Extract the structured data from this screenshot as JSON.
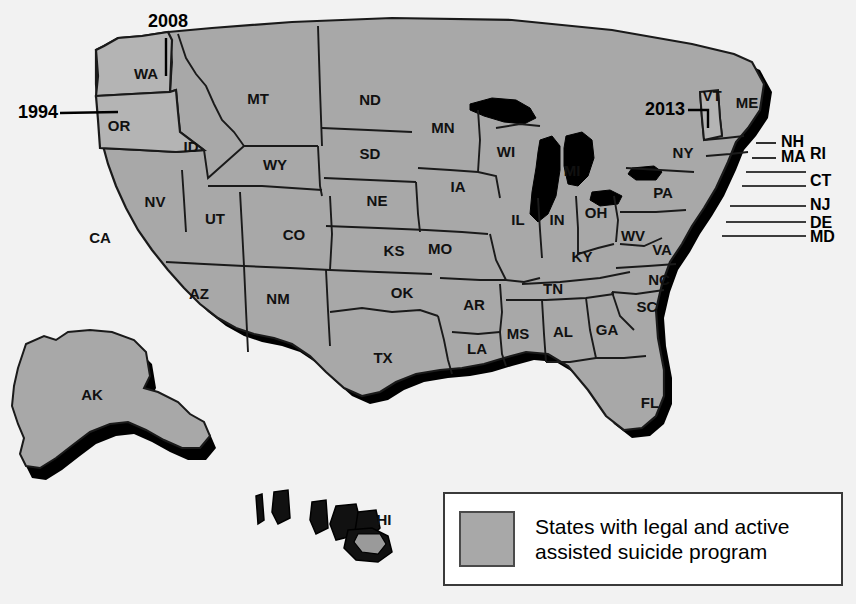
{
  "image": {
    "kind": "map",
    "region": "United States",
    "background_color": "#f2f2f2"
  },
  "colors": {
    "state_fill": "#a8a8a8",
    "state_fill_highlight": "#b4b4b4",
    "state_border": "#1a1a1a",
    "shadow": "#000000",
    "water": "#000000",
    "label_text": "#111111",
    "legend_background": "#ffffff",
    "legend_border": "#3a3a3a",
    "legend_swatch": "#a8a8a8"
  },
  "legend": {
    "swatch_name": "legend-color-swatch",
    "line1": "States with legal and active",
    "line2": "assisted suicide program",
    "full_text": "States with legal and active assisted suicide program"
  },
  "callouts": [
    {
      "id": "or-1994",
      "label": "1994",
      "points_to": "OR",
      "x": 18,
      "y": 113
    },
    {
      "id": "wa-2008",
      "label": "2008",
      "points_to": "WA",
      "x": 148,
      "y": 22
    },
    {
      "id": "vt-2013",
      "label": "2013",
      "points_to": "VT",
      "x": 645,
      "y": 110
    }
  ],
  "state_labels": [
    {
      "code": "WA",
      "x": 146,
      "y": 75
    },
    {
      "code": "OR",
      "x": 119,
      "y": 127
    },
    {
      "code": "ID",
      "x": 191,
      "y": 148
    },
    {
      "code": "MT",
      "x": 258,
      "y": 100
    },
    {
      "code": "ND",
      "x": 370,
      "y": 101
    },
    {
      "code": "SD",
      "x": 370,
      "y": 155
    },
    {
      "code": "MN",
      "x": 443,
      "y": 129
    },
    {
      "code": "WI",
      "x": 506,
      "y": 153
    },
    {
      "code": "MI",
      "x": 572,
      "y": 172
    },
    {
      "code": "NY",
      "x": 683,
      "y": 154
    },
    {
      "code": "VT",
      "x": 712,
      "y": 97
    },
    {
      "code": "ME",
      "x": 747,
      "y": 104
    },
    {
      "code": "WY",
      "x": 275,
      "y": 166
    },
    {
      "code": "NE",
      "x": 377,
      "y": 202
    },
    {
      "code": "IA",
      "x": 458,
      "y": 188
    },
    {
      "code": "IL",
      "x": 518,
      "y": 221
    },
    {
      "code": "IN",
      "x": 557,
      "y": 221
    },
    {
      "code": "OH",
      "x": 596,
      "y": 214
    },
    {
      "code": "PA",
      "x": 663,
      "y": 194
    },
    {
      "code": "NV",
      "x": 155,
      "y": 203
    },
    {
      "code": "UT",
      "x": 215,
      "y": 220
    },
    {
      "code": "CO",
      "x": 294,
      "y": 236
    },
    {
      "code": "KS",
      "x": 394,
      "y": 252
    },
    {
      "code": "MO",
      "x": 440,
      "y": 250
    },
    {
      "code": "KY",
      "x": 582,
      "y": 258
    },
    {
      "code": "WV",
      "x": 633,
      "y": 237
    },
    {
      "code": "VA",
      "x": 662,
      "y": 251
    },
    {
      "code": "CA",
      "x": 100,
      "y": 239
    },
    {
      "code": "AZ",
      "x": 199,
      "y": 295
    },
    {
      "code": "NM",
      "x": 278,
      "y": 300
    },
    {
      "code": "OK",
      "x": 402,
      "y": 294
    },
    {
      "code": "AR",
      "x": 474,
      "y": 306
    },
    {
      "code": "TN",
      "x": 553,
      "y": 290
    },
    {
      "code": "NC",
      "x": 659,
      "y": 281
    },
    {
      "code": "SC",
      "x": 647,
      "y": 308
    },
    {
      "code": "MS",
      "x": 518,
      "y": 335
    },
    {
      "code": "AL",
      "x": 563,
      "y": 333
    },
    {
      "code": "GA",
      "x": 607,
      "y": 331
    },
    {
      "code": "LA",
      "x": 477,
      "y": 350
    },
    {
      "code": "TX",
      "x": 383,
      "y": 359
    },
    {
      "code": "FL",
      "x": 650,
      "y": 404
    },
    {
      "code": "AK",
      "x": 92,
      "y": 396
    },
    {
      "code": "HI",
      "x": 384,
      "y": 521
    }
  ],
  "edge_labels": [
    {
      "code": "NH",
      "x": 781,
      "y": 143
    },
    {
      "code": "MA",
      "x": 781,
      "y": 158
    },
    {
      "code": "RI",
      "x": 810,
      "y": 155
    },
    {
      "code": "CT",
      "x": 810,
      "y": 182
    },
    {
      "code": "NJ",
      "x": 810,
      "y": 206
    },
    {
      "code": "DE",
      "x": 810,
      "y": 224
    },
    {
      "code": "MD",
      "x": 810,
      "y": 238
    }
  ]
}
